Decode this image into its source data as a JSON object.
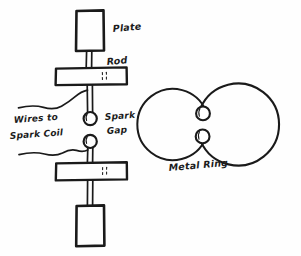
{
  "figure": {
    "background_color": "#fefefe",
    "ink_color": "#1a1a1a",
    "style": "hand-drawn line engraving"
  },
  "labels": {
    "plate": "Plate",
    "rod": "Rod",
    "wires_to_line1": "Wires to",
    "wires_to_line2": "Spark Coil",
    "spark_line1": "Spark",
    "spark_line2": "Gap",
    "metal_ring": "Metal Ring"
  },
  "oscillator": {
    "name": "spark-gap-oscillator",
    "top_plate": {
      "x": 76,
      "y": 10,
      "width": 28,
      "height": 41
    },
    "bottom_plate": {
      "x": 76,
      "y": 205,
      "width": 28,
      "height": 41
    },
    "top_block": {
      "x": 55,
      "y": 67,
      "width": 72,
      "height": 17
    },
    "bottom_block": {
      "x": 55,
      "y": 162,
      "width": 72,
      "height": 17
    },
    "upper_sphere": {
      "cx": 90,
      "cy": 118,
      "r": 7
    },
    "lower_sphere": {
      "cx": 90,
      "cy": 141,
      "r": 7
    },
    "rod_width": 6,
    "gap_description": "spark gap between two brass spheres"
  },
  "resonator": {
    "name": "metal-ring-resonator",
    "center": {
      "cx": 238,
      "cy": 124
    },
    "outer_radius": 41,
    "inner_radius": 36,
    "gap_side": "left",
    "sphere_upper": {
      "cx": 203,
      "cy": 113,
      "r": 7
    },
    "sphere_lower": {
      "cx": 203,
      "cy": 136,
      "r": 7
    }
  },
  "wires": [
    {
      "name": "upper-wire-to-spark-coil",
      "from": "left edge",
      "to": "upper rod"
    },
    {
      "name": "lower-wire-to-spark-coil",
      "from": "left edge",
      "to": "lower rod"
    }
  ]
}
